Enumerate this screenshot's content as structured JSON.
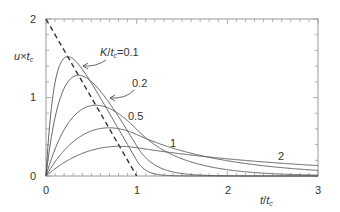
{
  "chart_data": {
    "type": "line",
    "title": "",
    "xlabel": "t/t_c",
    "ylabel": "u×t_c",
    "xlim": [
      0,
      3
    ],
    "ylim": [
      0,
      2
    ],
    "x_ticks": [
      "0",
      "1",
      "2",
      "3"
    ],
    "y_ticks": [
      "0",
      "1",
      "2"
    ],
    "grid": false,
    "series": [
      {
        "name": "input (dashed)",
        "style": "dashed",
        "x": [
          0,
          1,
          1.2
        ],
        "y": [
          2,
          0,
          0
        ]
      },
      {
        "name": "K/t_c=0.1",
        "K": 0.1,
        "peak": [
          0.24,
          1.52
        ],
        "x": [
          0,
          0.1,
          0.24,
          0.5,
          0.8,
          1.0,
          1.2
        ],
        "y": [
          0,
          1.2,
          1.52,
          1.1,
          0.5,
          0.2,
          0.03
        ]
      },
      {
        "name": "0.2",
        "K": 0.2,
        "peak": [
          0.36,
          1.29
        ],
        "x": [
          0,
          0.2,
          0.36,
          0.6,
          1.0,
          1.5
        ],
        "y": [
          0,
          1.1,
          1.29,
          1.0,
          0.4,
          0.03
        ]
      },
      {
        "name": "0.5",
        "K": 0.5,
        "peak": [
          0.55,
          0.9
        ],
        "x": [
          0,
          0.3,
          0.55,
          1.0,
          1.5,
          2.0,
          3.0
        ],
        "y": [
          0,
          0.75,
          0.9,
          0.6,
          0.22,
          0.08,
          0.01
        ]
      },
      {
        "name": "1",
        "K": 1,
        "peak": [
          0.75,
          0.6
        ],
        "x": [
          0,
          0.5,
          0.75,
          1.0,
          2.0,
          3.0
        ],
        "y": [
          0,
          0.5,
          0.6,
          0.53,
          0.19,
          0.07
        ]
      },
      {
        "name": "2",
        "K": 2,
        "peak": [
          0.88,
          0.37
        ],
        "x": [
          0,
          0.5,
          0.88,
          1.0,
          2.0,
          3.0
        ],
        "y": [
          0,
          0.28,
          0.37,
          0.36,
          0.22,
          0.13
        ]
      }
    ],
    "annotations": [
      "K/t_c=0.1",
      "0.2",
      "0.5",
      "1",
      "2"
    ]
  },
  "labels": {
    "y_axis_u": "u",
    "y_axis_x": "×",
    "y_axis_t": "t",
    "y_axis_sub": "c",
    "x_axis_t": "t",
    "x_axis_slash": "/",
    "x_axis_t2": "t",
    "x_axis_sub": "c",
    "ann_K": "K",
    "ann_slash": "/",
    "ann_t": "t",
    "ann_sub": "c",
    "ann_val": "=0.1",
    "ann_02": "0.2",
    "ann_05": "0.5",
    "ann_1": "1",
    "ann_2": "2",
    "xt0": "0",
    "xt1": "1",
    "xt2": "2",
    "xt3": "3",
    "yt0": "0",
    "yt1": "1",
    "yt2": "2"
  }
}
